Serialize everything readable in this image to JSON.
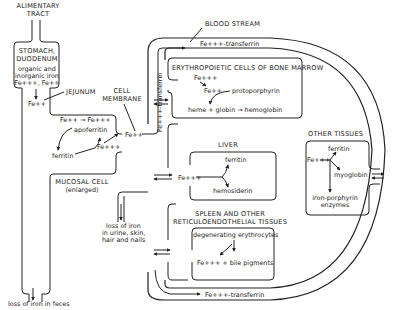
{
  "diagram": {
    "alimentary": {
      "label_line1": "ALIMENTARY",
      "label_line2": "TRACT"
    },
    "stomach": {
      "label_line1": "STOMACH,",
      "label_line2": "DUODENUM",
      "text_line1": "organic and",
      "text_line2": "inorganic iron",
      "text_line3": "Fe+++, Fe++"
    },
    "jejunum": {
      "label": "JEJUNUM",
      "fe": "Fe++"
    },
    "mucosal_cell": {
      "label_line1": "MUCOSAL CELL",
      "label_line2": "(enlarged)",
      "conversion": "Fe++ → Fe+++",
      "apoferritin": "apoferritin",
      "ferritin": "ferritin",
      "fe3": "Fe+++"
    },
    "cell_membrane": {
      "label_line1": "CELL",
      "label_line2": "MEMBRANE",
      "fe": "Fe++"
    },
    "blood_stream": {
      "label": "BLOOD STREAM",
      "top_transferrin": "Fe+++-transferrin",
      "vertical_transferrin": "Fe+++-transferrin",
      "bottom_transferrin": "Fe+++-transferrin"
    },
    "bone_marrow": {
      "label": "ERYTHROPOIETIC CELLS OF BONE MARROW",
      "fe3": "Fe+++",
      "fe2": "Fe++",
      "protoporphyrin": "protoporphyrin",
      "reaction": "heme + globin → hemoglobin"
    },
    "liver": {
      "label": "LIVER",
      "fe": "Fe+++",
      "ferritin": "ferritin",
      "hemosiderin": "hemosiderin"
    },
    "spleen": {
      "label_line1": "SPLEEN AND OTHER",
      "label_line2": "RETICULOENDOTHELIAL TISSUES",
      "degenerating": "degenerating erythrocytes",
      "products": "Fe+++ + bile pigments"
    },
    "other_tissues": {
      "label": "OTHER TISSUES",
      "fe": "Fe+++",
      "ferritin": "ferritin",
      "myoglobin": "myoglobin",
      "enzymes_line1": "iron-porphyrin",
      "enzymes_line2": "enzymes"
    },
    "losses": {
      "feces": "loss of iron in feces",
      "other_line1": "loss of iron",
      "other_line2": "in urine, skin,",
      "other_line3": "hair and nails"
    }
  }
}
